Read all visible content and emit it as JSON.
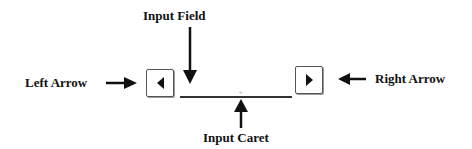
{
  "labels": {
    "input_field": "Input Field",
    "left_arrow": "Left Arrow",
    "right_arrow": "Right Arrow",
    "input_caret": "Input Caret"
  },
  "widget": {
    "left_button_icon": "triangle-left-icon",
    "right_button_icon": "triangle-right-icon",
    "input_value": "",
    "caret_glyph": "+"
  },
  "colors": {
    "ink": "#111111",
    "button_border": "#555555",
    "field_line": "#333333",
    "background": "#ffffff"
  }
}
